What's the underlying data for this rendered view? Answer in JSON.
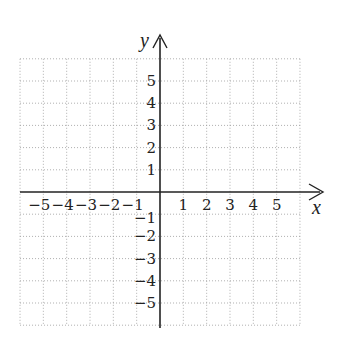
{
  "diagram": {
    "type": "coordinate-plane",
    "x_axis_label": "x",
    "y_axis_label": "y",
    "x_range": [
      -6,
      6
    ],
    "y_range": [
      -6,
      6
    ],
    "grid": "dotted",
    "x_tick_labels": [
      "−5",
      "−4",
      "−3",
      "−2",
      "−1",
      "1",
      "2",
      "3",
      "4",
      "5"
    ],
    "x_tick_values": [
      -5,
      -4,
      -3,
      -2,
      -1,
      1,
      2,
      3,
      4,
      5
    ],
    "y_tick_labels": [
      "5",
      "4",
      "3",
      "2",
      "1",
      "−1",
      "−2",
      "−3",
      "−4",
      "−5"
    ],
    "y_tick_values": [
      5,
      4,
      3,
      2,
      1,
      -1,
      -2,
      -3,
      -4,
      -5
    ],
    "colors": {
      "axis": "#222222",
      "grid": "#9a9a9a",
      "background": "#ffffff"
    }
  }
}
